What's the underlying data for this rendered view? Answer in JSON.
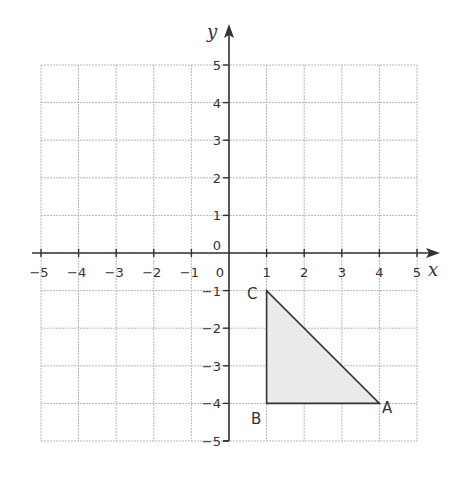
{
  "chart_data": {
    "type": "scatter",
    "title": "",
    "xlabel": "x",
    "ylabel": "y",
    "xlim": [
      -5,
      5
    ],
    "ylim": [
      -5,
      5
    ],
    "grid": true,
    "x_ticks": [
      "-5",
      "-4",
      "-3",
      "-2",
      "-1",
      "0",
      "1",
      "2",
      "3",
      "4",
      "5"
    ],
    "y_ticks": [
      "5",
      "4",
      "3",
      "2",
      "1",
      "0",
      "-1",
      "-2",
      "-3",
      "-4",
      "-5"
    ],
    "shapes": [
      {
        "name": "triangle ABC",
        "fill": "#ebebeb",
        "vertices": [
          {
            "label": "A",
            "x": 4,
            "y": -4
          },
          {
            "label": "B",
            "x": 1,
            "y": -4
          },
          {
            "label": "C",
            "x": 1,
            "y": -1
          }
        ]
      }
    ]
  },
  "labels": {
    "x_axis": "x",
    "y_axis": "y",
    "origin_x": "0",
    "origin_y": "0",
    "A": "A",
    "B": "B",
    "C": "C"
  },
  "colors": {
    "grid": "#b8b8b8",
    "axis": "#333333",
    "fill": "#ebebeb"
  }
}
